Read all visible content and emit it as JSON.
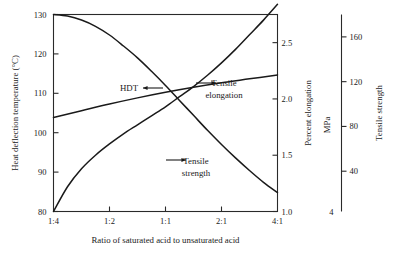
{
  "chart_data": {
    "type": "line",
    "title": "",
    "xlabel": "Ratio of saturated acid to unsaturated acid",
    "ylabel": "Heat deflection temperature (°C)",
    "grid": false,
    "legend_position": "inline-annotations",
    "x_categories": [
      "1:4",
      "1:2",
      "1:1",
      "2:1",
      "4:1"
    ],
    "x_positions": [
      0,
      1,
      2,
      3,
      4
    ],
    "xlim": [
      0,
      4
    ],
    "axes": [
      {
        "id": "left",
        "label": "Heat deflection temperature (°C)",
        "ticks": [
          80,
          90,
          100,
          110,
          120,
          130
        ],
        "tick_labels": [
          "80",
          "90",
          "100",
          "110",
          "120",
          "130"
        ],
        "range": [
          80,
          130
        ],
        "side": "left"
      },
      {
        "id": "right-elongation",
        "label": "Percent elongation",
        "ticks": [
          1.0,
          1.5,
          2.0,
          2.5
        ],
        "tick_labels": [
          "1.0",
          "1.5",
          "2.0",
          "2.5"
        ],
        "range": [
          1.0,
          2.75
        ],
        "side": "right"
      },
      {
        "id": "right-strength",
        "label": "Tensile strength",
        "unit_label": "MPa",
        "ticks": [
          40,
          80,
          120,
          160
        ],
        "tick_labels": [
          "40",
          "80",
          "120",
          "160"
        ],
        "origin_label": "4",
        "range": [
          4,
          180
        ],
        "side": "far-right"
      }
    ],
    "series": [
      {
        "name": "HDT",
        "axis": "left",
        "annotation": "HDT",
        "arrow_direction": "left",
        "points": [
          {
            "x": 0.0,
            "y": 130.0
          },
          {
            "x": 0.25,
            "y": 129.6
          },
          {
            "x": 0.5,
            "y": 128.6
          },
          {
            "x": 0.75,
            "y": 127.0
          },
          {
            "x": 1.0,
            "y": 124.8
          },
          {
            "x": 1.25,
            "y": 122.0
          },
          {
            "x": 1.5,
            "y": 119.0
          },
          {
            "x": 1.75,
            "y": 115.6
          },
          {
            "x": 2.0,
            "y": 112.0
          },
          {
            "x": 2.25,
            "y": 108.2
          },
          {
            "x": 2.5,
            "y": 104.4
          },
          {
            "x": 2.75,
            "y": 100.6
          },
          {
            "x": 3.0,
            "y": 97.0
          },
          {
            "x": 3.25,
            "y": 93.6
          },
          {
            "x": 3.5,
            "y": 90.4
          },
          {
            "x": 3.75,
            "y": 87.4
          },
          {
            "x": 4.0,
            "y": 84.8
          }
        ]
      },
      {
        "name": "Tensile elongation",
        "axis": "right-elongation",
        "annotation": "Tensile elongation",
        "arrow_direction": "right",
        "points": [
          {
            "x": 0.0,
            "y": 1.0
          },
          {
            "x": 0.25,
            "y": 1.22
          },
          {
            "x": 0.5,
            "y": 1.38
          },
          {
            "x": 0.75,
            "y": 1.5
          },
          {
            "x": 1.0,
            "y": 1.6
          },
          {
            "x": 1.25,
            "y": 1.69
          },
          {
            "x": 1.5,
            "y": 1.77
          },
          {
            "x": 1.75,
            "y": 1.85
          },
          {
            "x": 2.0,
            "y": 1.93
          },
          {
            "x": 2.25,
            "y": 2.02
          },
          {
            "x": 2.5,
            "y": 2.11
          },
          {
            "x": 2.75,
            "y": 2.21
          },
          {
            "x": 3.0,
            "y": 2.32
          },
          {
            "x": 3.25,
            "y": 2.44
          },
          {
            "x": 3.5,
            "y": 2.57
          },
          {
            "x": 3.75,
            "y": 2.7
          },
          {
            "x": 4.0,
            "y": 2.84
          }
        ]
      },
      {
        "name": "Tensile strength",
        "axis": "right-strength",
        "annotation": "Tensile strength",
        "arrow_direction": "right",
        "points": [
          {
            "x": 0.0,
            "y": 88.0
          },
          {
            "x": 0.5,
            "y": 94.0
          },
          {
            "x": 1.0,
            "y": 100.0
          },
          {
            "x": 1.5,
            "y": 105.5
          },
          {
            "x": 2.0,
            "y": 110.5
          },
          {
            "x": 2.5,
            "y": 115.0
          },
          {
            "x": 3.0,
            "y": 119.0
          },
          {
            "x": 3.5,
            "y": 122.5
          },
          {
            "x": 4.0,
            "y": 126.0
          }
        ]
      }
    ],
    "annotations": [
      {
        "text": "HDT",
        "x": 129,
        "y": 91
      },
      {
        "text": "Tensile",
        "x": 224,
        "y": 86
      },
      {
        "text": "elongation",
        "x": 224,
        "y": 98
      },
      {
        "text": "Tensile",
        "x": 196,
        "y": 164
      },
      {
        "text": "strength",
        "x": 196,
        "y": 176
      }
    ]
  }
}
